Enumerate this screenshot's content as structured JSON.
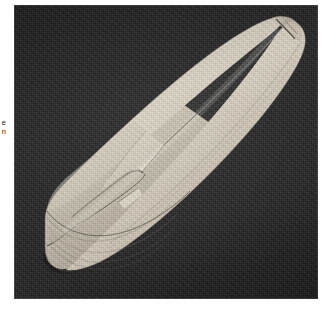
{
  "page": {
    "background_color": "#ffffff",
    "width": 326,
    "height": 314
  },
  "margin_notes": {
    "line1": "e",
    "line2": "n"
  },
  "figure": {
    "caption": "",
    "plate": {
      "background_color": "#232323",
      "border_color": "#5a5a5a",
      "left": 14,
      "top": 5,
      "width": 304,
      "height": 294
    },
    "subject": {
      "name": "wooden bread-and-butter ship hull model",
      "description": "Half-finished laminated wooden boat hull shown upside down on a dark ground, bow at lower left with visible stepped lifts, stern tapering to a point at upper right",
      "material_color": "#ded6c6",
      "highlight_color": "#f2ece1",
      "shadow_color": "#8e8madd",
      "orientation": "diagonal, bow lower-left to stern upper-right"
    }
  },
  "colors": {
    "photo_ground": "#232323",
    "wood_light": "#efe9dd",
    "wood_mid": "#d8d0c0",
    "wood_dark": "#a9a193",
    "wood_shadow": "#7d7668",
    "line_ink": "#3a362f",
    "paper": "#ffffff"
  }
}
